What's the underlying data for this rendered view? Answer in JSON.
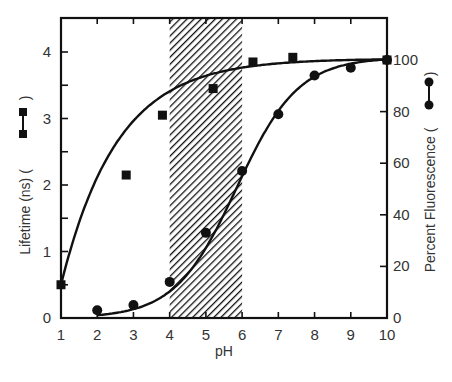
{
  "chart_data": {
    "type": "line",
    "title": "",
    "xlabel": "pH",
    "ylabel": "Lifetime (ns)",
    "y2label": "Percent Fluorescence",
    "xlim": [
      1,
      10
    ],
    "ylim": [
      0,
      4.5
    ],
    "y2lim": [
      0,
      100
    ],
    "x_ticks": [
      1,
      2,
      3,
      4,
      5,
      6,
      7,
      8,
      9,
      10
    ],
    "y_ticks": [
      0,
      1,
      2,
      3,
      4
    ],
    "y2_ticks": [
      0,
      20,
      40,
      60,
      80,
      100
    ],
    "grid": false,
    "shaded_region": {
      "x_start": 4,
      "x_end": 6,
      "pattern": "diagonal-hatch"
    },
    "series": [
      {
        "name": "Lifetime (ns)",
        "axis": "left",
        "marker": "square",
        "x": [
          1,
          2.8,
          3.8,
          5.2,
          6.3,
          7.4,
          10
        ],
        "values": [
          0.5,
          2.15,
          3.05,
          3.45,
          3.85,
          3.92,
          3.88
        ]
      },
      {
        "name": "Percent Fluorescence",
        "axis": "right",
        "marker": "circle",
        "x": [
          2,
          3,
          4,
          5,
          6,
          7,
          8,
          9,
          10
        ],
        "values": [
          3,
          5,
          14,
          33,
          57,
          79,
          94,
          97,
          100
        ]
      }
    ]
  },
  "labels": {
    "x_axis": "pH",
    "left_axis": "Lifetime (ns) (",
    "right_axis": "Percent Fluorescence (",
    "close_paren": ")"
  }
}
